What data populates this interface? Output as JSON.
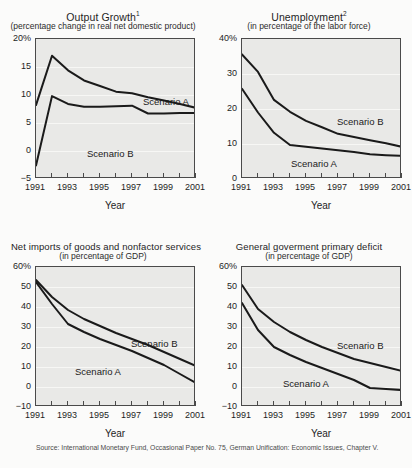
{
  "figure": {
    "source_note": "Source: International Monetary Fund, Occasional Paper No. 75, German Unification: Economic Issues, Chapter V.",
    "xlabel": "Year",
    "scenario_a": "Scenario A",
    "scenario_b": "Scenario B"
  },
  "chart_data": [
    {
      "id": "output-growth",
      "type": "line",
      "title": "Output Growth",
      "title_superscript": "1",
      "subtitle": "(percentage change in real net domestic product)",
      "xlabel": "Year",
      "ylabel": "",
      "ylim": [
        -5,
        20
      ],
      "yticks": [
        -5,
        0,
        5,
        10,
        15,
        20
      ],
      "ytick_labels": [
        "−5",
        "0",
        "5",
        "10",
        "15",
        "20%"
      ],
      "grid": true,
      "x": [
        1991,
        1992,
        1993,
        1994,
        1995,
        1996,
        1997,
        1998,
        1999,
        2000,
        2001
      ],
      "xtick_labels": [
        "1991",
        "1993",
        "1995",
        "1997",
        "1999",
        "2001"
      ],
      "series": [
        {
          "name": "Scenario A",
          "values": [
            8.2,
            17.0,
            14.4,
            12.6,
            11.6,
            10.6,
            10.3,
            9.6,
            9.0,
            8.4,
            7.7
          ]
        },
        {
          "name": "Scenario B",
          "values": [
            -2.6,
            9.8,
            8.4,
            7.9,
            7.9,
            8.0,
            8.1,
            6.7,
            6.7,
            6.8,
            6.8
          ]
        }
      ]
    },
    {
      "id": "unemployment",
      "type": "line",
      "title": "Unemployment",
      "title_superscript": "2",
      "subtitle": "(in percentage of the labor force)",
      "xlabel": "Year",
      "ylabel": "",
      "ylim": [
        0,
        40
      ],
      "yticks": [
        0,
        10,
        20,
        30,
        40
      ],
      "ytick_labels": [
        "0",
        "10",
        "20",
        "30",
        "40%"
      ],
      "grid": true,
      "x": [
        1991,
        1992,
        1993,
        1994,
        1995,
        1996,
        1997,
        1998,
        1999,
        2000,
        2001
      ],
      "xtick_labels": [
        "1991",
        "1993",
        "1995",
        "1997",
        "1999",
        "2001"
      ],
      "series": [
        {
          "name": "Scenario B",
          "values": [
            35.6,
            30.6,
            22.6,
            19.2,
            16.6,
            14.8,
            12.9,
            12.0,
            11.1,
            10.2,
            9.2
          ]
        },
        {
          "name": "Scenario A",
          "values": [
            25.8,
            19.0,
            13.2,
            9.7,
            9.2,
            8.7,
            8.2,
            7.7,
            7.1,
            6.8,
            6.6
          ]
        }
      ]
    },
    {
      "id": "net-imports",
      "type": "line",
      "title": "Net imports of goods and nonfactor services",
      "title_superscript": "",
      "subtitle": "(in percentage of GDP)",
      "xlabel": "Year",
      "ylabel": "",
      "ylim": [
        -10,
        60
      ],
      "yticks": [
        -10,
        0,
        10,
        20,
        30,
        40,
        50,
        60
      ],
      "ytick_labels": [
        "−10",
        "0",
        "10",
        "20",
        "30",
        "40",
        "50",
        "60%"
      ],
      "grid": true,
      "x": [
        1991,
        1992,
        1993,
        1994,
        1995,
        1996,
        1997,
        1998,
        1999,
        2000,
        2001
      ],
      "xtick_labels": [
        "1991",
        "1993",
        "1995",
        "1997",
        "1999",
        "2001"
      ],
      "series": [
        {
          "name": "Scenario B",
          "values": [
            53.5,
            45.0,
            38.5,
            34.0,
            30.5,
            27.0,
            24.0,
            21.0,
            17.5,
            14.0,
            10.5
          ]
        },
        {
          "name": "Scenario A",
          "values": [
            52.5,
            41.5,
            31.5,
            27.5,
            24.0,
            21.0,
            18.0,
            14.5,
            11.0,
            6.5,
            2.0
          ]
        }
      ]
    },
    {
      "id": "primary-deficit",
      "type": "line",
      "title": "General goverment primary deficit",
      "title_superscript": "",
      "subtitle": "(in percentage of GDP)",
      "xlabel": "Year",
      "ylabel": "",
      "ylim": [
        -10,
        60
      ],
      "yticks": [
        -10,
        0,
        10,
        20,
        30,
        40,
        50,
        60
      ],
      "ytick_labels": [
        "−10",
        "0",
        "10",
        "20",
        "30",
        "40",
        "50",
        "60%"
      ],
      "grid": true,
      "x": [
        1991,
        1992,
        1993,
        1994,
        1995,
        1996,
        1997,
        1998,
        1999,
        2000,
        2001
      ],
      "xtick_labels": [
        "1991",
        "1993",
        "1995",
        "1997",
        "1999",
        "2001"
      ],
      "series": [
        {
          "name": "Scenario B",
          "values": [
            51.0,
            39.0,
            32.5,
            27.5,
            23.5,
            20.0,
            17.0,
            14.0,
            12.0,
            10.0,
            8.0
          ]
        },
        {
          "name": "Scenario A",
          "values": [
            42.0,
            28.5,
            20.0,
            16.0,
            12.5,
            9.5,
            6.5,
            3.5,
            -0.5,
            -1.0,
            -1.5
          ]
        }
      ]
    }
  ]
}
